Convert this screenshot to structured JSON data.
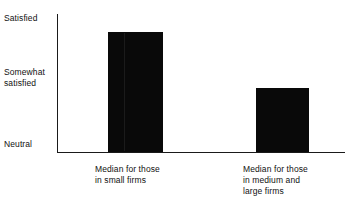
{
  "chart_data": {
    "type": "bar",
    "title": "",
    "xlabel": "",
    "ylabel": "",
    "categories": [
      "Median for those\nin small firms",
      "Median for those\nin medium and\nlarge firms"
    ],
    "values": [
      2.78,
      2.0
    ],
    "ylim": [
      1,
      3
    ],
    "ytick_labels": [
      "Neutral",
      "Somewhat\nsatisfied",
      "Satisfied"
    ],
    "ytick_values": [
      1,
      2,
      3
    ],
    "grid": false,
    "legend": null,
    "bar_color": "#090909",
    "axis_color": "#1a1a1a",
    "background_color": "#ffffff",
    "series": [
      {
        "name": "Median satisfaction",
        "values": [
          2.78,
          2.0
        ]
      }
    ],
    "annotations": []
  },
  "axis": {
    "y_labels": {
      "top": "Satisfied",
      "middle": "Somewhat\nsatisfied",
      "bottom": "Neutral"
    }
  },
  "bars": [
    {
      "name": "small-firms",
      "label": "Median for those\nin small firms",
      "value": 2.78
    },
    {
      "name": "medium-large-firms",
      "label": "Median for those\nin medium and\nlarge firms",
      "value": 2.0
    }
  ]
}
